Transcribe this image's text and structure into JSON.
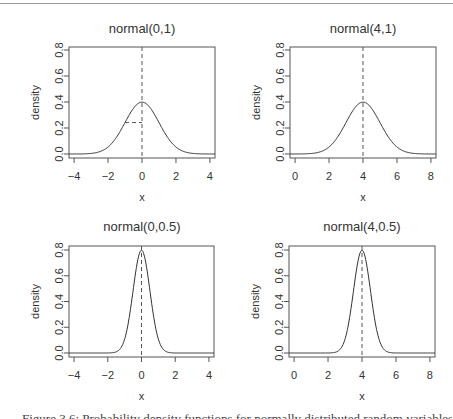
{
  "chart_data": [
    {
      "type": "line",
      "title": "normal(0,1)",
      "xlabel": "x",
      "ylabel": "density",
      "distribution": {
        "mean": 0,
        "sd": 1
      },
      "xlim": [
        -4.3,
        4.3
      ],
      "ylim": [
        0,
        0.8
      ],
      "xticks": [
        -4,
        -2,
        0,
        2,
        4
      ],
      "yticks": [
        0.0,
        0.2,
        0.4,
        0.6,
        0.8
      ],
      "ytick_labels": [
        "0.0",
        "0.2",
        "0.4",
        "0.6",
        "0.8"
      ],
      "peak_density": 0.399,
      "annotations": [
        {
          "type": "vline-dashed",
          "x": 0
        },
        {
          "type": "hsegment-dashed",
          "x_from": -1,
          "x_to": 0,
          "y": 0.242
        }
      ],
      "grid": false
    },
    {
      "type": "line",
      "title": "normal(4,1)",
      "xlabel": "x",
      "ylabel": "density",
      "distribution": {
        "mean": 4,
        "sd": 1
      },
      "xlim": [
        -0.3,
        8.3
      ],
      "ylim": [
        0,
        0.8
      ],
      "xticks": [
        0,
        2,
        4,
        6,
        8
      ],
      "yticks": [
        0.0,
        0.2,
        0.4,
        0.6,
        0.8
      ],
      "ytick_labels": [
        "0.0",
        "0.2",
        "0.4",
        "0.6",
        "0.8"
      ],
      "peak_density": 0.399,
      "annotations": [
        {
          "type": "vline-dashed",
          "x": 4
        }
      ],
      "grid": false
    },
    {
      "type": "line",
      "title": "normal(0,0.5)",
      "xlabel": "x",
      "ylabel": "density",
      "distribution": {
        "mean": 0,
        "sd": 0.5
      },
      "xlim": [
        -4.3,
        4.3
      ],
      "ylim": [
        0,
        0.8
      ],
      "xticks": [
        -4,
        -2,
        0,
        2,
        4
      ],
      "yticks": [
        0.0,
        0.2,
        0.4,
        0.6,
        0.8
      ],
      "ytick_labels": [
        "0.0",
        "0.2",
        "0.4",
        "0.6",
        "0.8"
      ],
      "peak_density": 0.798,
      "annotations": [
        {
          "type": "vline-dashed",
          "x": 0
        }
      ],
      "grid": false
    },
    {
      "type": "line",
      "title": "normal(4,0.5)",
      "xlabel": "x",
      "ylabel": "density",
      "distribution": {
        "mean": 4,
        "sd": 0.5
      },
      "xlim": [
        -0.3,
        8.3
      ],
      "ylim": [
        0,
        0.8
      ],
      "xticks": [
        0,
        2,
        4,
        6,
        8
      ],
      "yticks": [
        0.0,
        0.2,
        0.4,
        0.6,
        0.8
      ],
      "ytick_labels": [
        "0.0",
        "0.2",
        "0.4",
        "0.6",
        "0.8"
      ],
      "peak_density": 0.798,
      "annotations": [
        {
          "type": "vline-dashed",
          "x": 4
        }
      ],
      "grid": false
    }
  ],
  "panels": [
    {
      "title": "normal(0,1)",
      "xlabel": "x",
      "ylabel": "density"
    },
    {
      "title": "normal(4,1)",
      "xlabel": "x",
      "ylabel": "density"
    },
    {
      "title": "normal(0,0.5)",
      "xlabel": "x",
      "ylabel": "density"
    },
    {
      "title": "normal(4,0.5)",
      "xlabel": "x",
      "ylabel": "density"
    }
  ],
  "caption": "Figure 3.6: Probability density functions for normally distributed random variables",
  "colors": {
    "curve": "#333333",
    "axis": "#555555",
    "dashed": "#555555",
    "text": "#333333",
    "rule": "#9a9a9a"
  }
}
